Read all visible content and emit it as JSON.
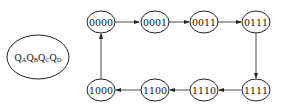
{
  "diagram": {
    "type": "state-transition",
    "legend": {
      "parts": [
        {
          "main": "Q",
          "sub": "A"
        },
        {
          "main": "Q",
          "sub": "B"
        },
        {
          "main": "Q",
          "sub": "C"
        },
        {
          "main": "Q",
          "sub": "D"
        }
      ]
    },
    "states": [
      {
        "id": "s0",
        "label": "0000"
      },
      {
        "id": "s1",
        "label": "0001"
      },
      {
        "id": "s2",
        "label": "0011"
      },
      {
        "id": "s3",
        "label": "0111"
      },
      {
        "id": "s4",
        "label": "1111"
      },
      {
        "id": "s5",
        "label": "1110"
      },
      {
        "id": "s6",
        "label": "1100"
      },
      {
        "id": "s7",
        "label": "1000"
      }
    ],
    "transitions": [
      {
        "from": "0000",
        "to": "0001"
      },
      {
        "from": "0001",
        "to": "0011"
      },
      {
        "from": "0011",
        "to": "0111"
      },
      {
        "from": "0111",
        "to": "1111"
      },
      {
        "from": "1111",
        "to": "1110"
      },
      {
        "from": "1110",
        "to": "1100"
      },
      {
        "from": "1100",
        "to": "1000"
      },
      {
        "from": "1000",
        "to": "0000"
      }
    ]
  }
}
